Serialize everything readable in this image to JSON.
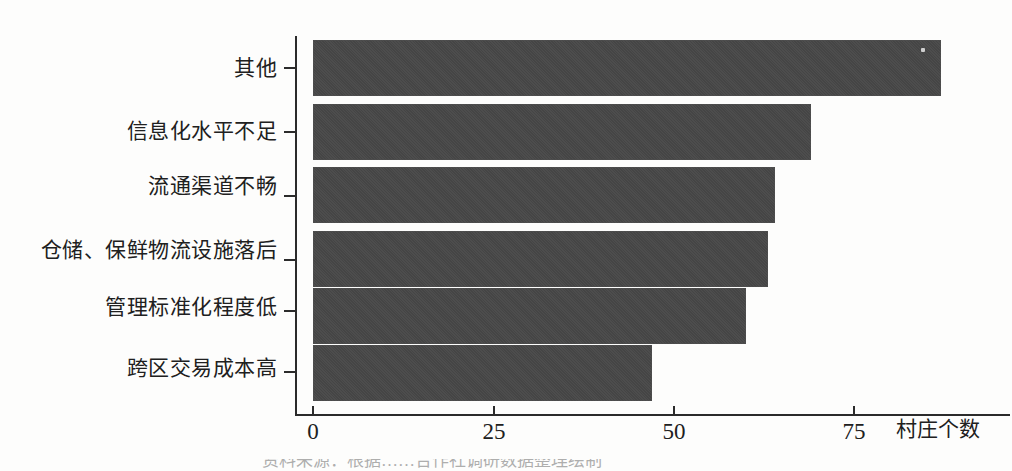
{
  "chart_data": {
    "type": "bar",
    "orientation": "horizontal",
    "title": "",
    "subtitle": "",
    "xlabel": "村庄个数",
    "ylabel": "",
    "categories": [
      "其他",
      "信息化水平不足",
      "流通渠道不畅",
      "仓储、保鲜物流设施落后",
      "管理标准化程度低",
      "跨区交易成本高"
    ],
    "values": [
      87,
      69,
      64,
      63,
      60,
      47
    ],
    "series": [
      {
        "name": "村庄个数",
        "values": [
          87,
          69,
          64,
          63,
          60,
          47
        ]
      }
    ],
    "xlim": [
      0,
      96
    ],
    "x_ticks": [
      0,
      25,
      50,
      75
    ],
    "x_tick_labels": [
      "0",
      "25",
      "50",
      "75"
    ],
    "grid": false,
    "legend": false,
    "legend_position": "none",
    "bar_color": "#474747",
    "axis_color": "#2b2b2b",
    "background_color": "#fdfdfc"
  },
  "axis": {
    "x_title": "村庄个数",
    "tick_labels": [
      "0",
      "25",
      "50",
      "75"
    ]
  },
  "caption": {
    "text": "资料来源：根据……合作社调研数据整理绘制",
    "note": "cropped at image bottom edge, only character tops visible"
  }
}
